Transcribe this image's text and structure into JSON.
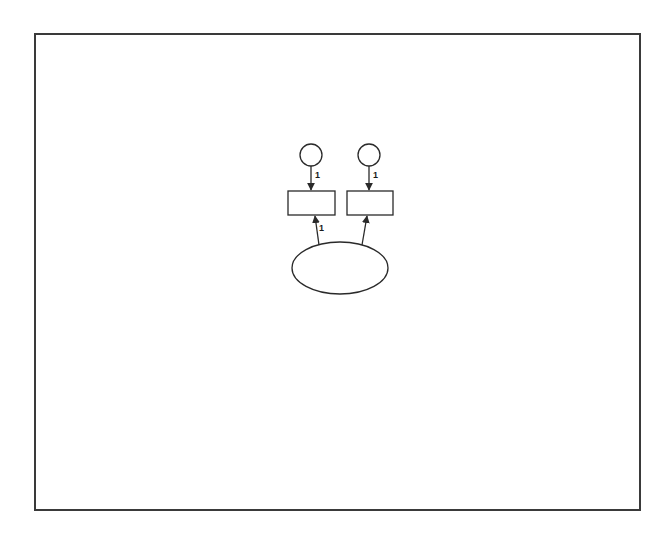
{
  "diagram": {
    "type": "path-diagram",
    "colors": {
      "stroke": "#2a2a2a",
      "background": "#ffffff",
      "frame": "#3a3a3a"
    },
    "nodes": [
      {
        "id": "e1",
        "shape": "circle",
        "label": "",
        "cx": 311,
        "cy": 155,
        "r": 11
      },
      {
        "id": "e2",
        "shape": "circle",
        "label": "",
        "cx": 369,
        "cy": 155,
        "r": 11
      },
      {
        "id": "x1",
        "shape": "rect",
        "label": "",
        "x": 288,
        "y": 191,
        "w": 47,
        "h": 24
      },
      {
        "id": "x2",
        "shape": "rect",
        "label": "",
        "x": 347,
        "y": 191,
        "w": 46,
        "h": 24
      },
      {
        "id": "F1",
        "shape": "ellipse",
        "label": "",
        "cx": 340,
        "cy": 268,
        "rx": 48,
        "ry": 26
      }
    ],
    "edges": [
      {
        "from": "e1",
        "to": "x1",
        "label": "1"
      },
      {
        "from": "e2",
        "to": "x2",
        "label": "1"
      },
      {
        "from": "F1",
        "to": "x1",
        "label": "1"
      },
      {
        "from": "F1",
        "to": "x2",
        "label": ""
      }
    ],
    "path_labels": {
      "e1_x1": "1",
      "e2_x2": "1",
      "F1_x1": "1"
    }
  }
}
